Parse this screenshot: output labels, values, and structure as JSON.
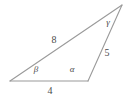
{
  "figure": {
    "type": "triangle-diagram",
    "background_color": "#ffffff",
    "stroke_color": "#9a9a9a",
    "label_color": "#4a4a4a",
    "vertices": {
      "left": {
        "x": 10,
        "y": 81
      },
      "bottom_right": {
        "x": 88,
        "y": 81
      },
      "apex": {
        "x": 122,
        "y": 5
      }
    },
    "sides": {
      "base": {
        "label": "4",
        "label_x": 50,
        "label_y": 91
      },
      "long": {
        "label": "8",
        "label_x": 54,
        "label_y": 40
      },
      "right": {
        "label": "5",
        "label_x": 107,
        "label_y": 53
      }
    },
    "angles": {
      "beta": {
        "label": "β",
        "label_x": 36,
        "label_y": 69
      },
      "alpha": {
        "label": "α",
        "label_x": 72,
        "label_y": 69
      },
      "gamma": {
        "label": "γ",
        "label_x": 108,
        "label_y": 22
      }
    }
  }
}
